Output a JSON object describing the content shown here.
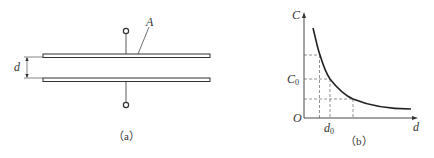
{
  "figure_a": {
    "caption": "（a）",
    "area_label": "A",
    "gap_label": "d"
  },
  "figure_b": {
    "caption": "（b）",
    "y_axis_label": "C",
    "x_axis_label": "d",
    "origin_label": "O",
    "c0_label": "C",
    "c0_sub": "0",
    "d0_label": "d",
    "d0_sub": "0"
  },
  "colors": {
    "line": "#333333",
    "dash": "#555555"
  }
}
